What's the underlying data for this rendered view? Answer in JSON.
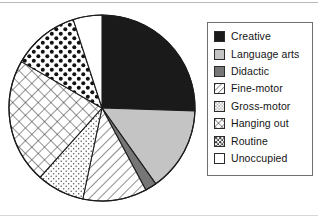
{
  "figure": {
    "title": "",
    "pie": {
      "center_x": 102,
      "center_y": 108,
      "radius": 93,
      "start_angle_deg": 0,
      "direction": "clockwise",
      "outline_color": "#1c1c1c"
    }
  },
  "legend": {
    "position": "right",
    "border_color": "#6f6f6f",
    "items": [
      {
        "label": "Creative",
        "swatch": "solid-black",
        "icon": "legend-swatch-icon"
      },
      {
        "label": "Language arts",
        "swatch": "solid-lightgray",
        "icon": "legend-swatch-icon"
      },
      {
        "label": "Didactic",
        "swatch": "solid-darkgray",
        "icon": "legend-swatch-icon"
      },
      {
        "label": "Fine-motor",
        "swatch": "diagonal-lines",
        "icon": "legend-swatch-icon"
      },
      {
        "label": "Gross-motor",
        "swatch": "fine-dots",
        "icon": "legend-swatch-icon"
      },
      {
        "label": "Hanging out",
        "swatch": "crosshatch",
        "icon": "legend-swatch-icon"
      },
      {
        "label": "Routine",
        "swatch": "dense-dots",
        "icon": "legend-swatch-icon"
      },
      {
        "label": "Unoccupied",
        "swatch": "empty-white",
        "icon": "legend-swatch-icon"
      }
    ]
  },
  "chart_data": {
    "type": "pie",
    "title": "",
    "xlabel": "",
    "ylabel": "",
    "legend_position": "right",
    "grid": false,
    "start_angle_deg": 0,
    "direction": "clockwise",
    "categories": [
      "Creative",
      "Language arts",
      "Didactic",
      "Fine-motor",
      "Gross-motor",
      "Hanging out",
      "Routine",
      "Unoccupied"
    ],
    "values": [
      25.5,
      14.7,
      2.0,
      11.1,
      8.3,
      21.7,
      11.7,
      5.0
    ],
    "units": "percent",
    "angles_deg": [
      91.8,
      52.9,
      7.2,
      40.0,
      29.9,
      78.1,
      42.1,
      18.0
    ],
    "slices": [
      {
        "label": "Creative",
        "value": 25.5,
        "start_deg": 0.0,
        "end_deg": 91.8,
        "fill": "#1a1a1a",
        "pattern": "solid"
      },
      {
        "label": "Language arts",
        "value": 14.7,
        "start_deg": 91.8,
        "end_deg": 144.7,
        "fill": "#c4c4c4",
        "pattern": "solid"
      },
      {
        "label": "Didactic",
        "value": 2.0,
        "start_deg": 144.7,
        "end_deg": 151.9,
        "fill": "#767676",
        "pattern": "solid"
      },
      {
        "label": "Fine-motor",
        "value": 11.1,
        "start_deg": 151.9,
        "end_deg": 191.9,
        "fill": "#ffffff",
        "pattern": "diagonal-lines"
      },
      {
        "label": "Gross-motor",
        "value": 8.3,
        "start_deg": 191.9,
        "end_deg": 221.8,
        "fill": "#ffffff",
        "pattern": "fine-dots"
      },
      {
        "label": "Hanging out",
        "value": 21.7,
        "start_deg": 221.8,
        "end_deg": 299.9,
        "fill": "#ffffff",
        "pattern": "crosshatch"
      },
      {
        "label": "Routine",
        "value": 11.7,
        "start_deg": 299.9,
        "end_deg": 342.0,
        "fill": "#ffffff",
        "pattern": "dense-dots"
      },
      {
        "label": "Unoccupied",
        "value": 5.0,
        "start_deg": 342.0,
        "end_deg": 360.0,
        "fill": "#ffffff",
        "pattern": "none"
      }
    ]
  }
}
